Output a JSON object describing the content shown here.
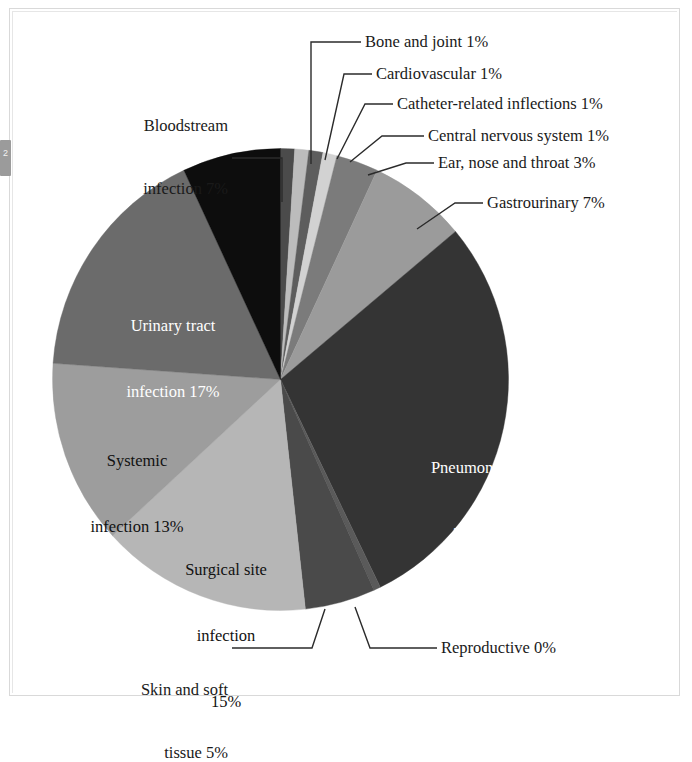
{
  "figure": {
    "type": "pie-chart-figure",
    "edge_tab_glyph": "2"
  },
  "chart_data": {
    "type": "pie",
    "title": "",
    "subtitle": "",
    "xlabel": "",
    "ylabel": "",
    "legend_position": "none",
    "units": "percent",
    "start_angle_deg": 0,
    "direction": "clockwise",
    "categories": [
      "Bone and joint",
      "Cardiovascular",
      "Catheter-related inflections",
      "Central nervous system",
      "Ear, nose and throat",
      "Gastrourinary",
      "Pneumonia",
      "Reproductive",
      "Skin and soft tissue",
      "Surgical site infection",
      "Systemic infection",
      "Urinary tract infection",
      "Bloodstream infection"
    ],
    "values": [
      1,
      1,
      1,
      1,
      3,
      7,
      29,
      0.5,
      5,
      15,
      13,
      17,
      7
    ],
    "value_labels": [
      "1%",
      "1%",
      "1%",
      "1%",
      "3%",
      "7%",
      "29%",
      "0%",
      "5%",
      "15%",
      "13%",
      "17%",
      "7%"
    ],
    "colors": [
      "#4b4b4b",
      "#bcbcbc",
      "#5d5d5d",
      "#d2d2d2",
      "#7b7b7b",
      "#9b9b9b",
      "#343434",
      "#5a5a5a",
      "#4a4a4a",
      "#b6b6b6",
      "#9d9d9d",
      "#6b6b6b",
      "#0d0d0d"
    ]
  },
  "callouts": [
    {
      "id": "bone-and-joint",
      "text": "Bone and joint 1%"
    },
    {
      "id": "cardiovascular",
      "text": "Cardiovascular 1%"
    },
    {
      "id": "catheter-related",
      "text": "Catheter-related inflections 1%"
    },
    {
      "id": "central-nervous-system",
      "text": "Central nervous system 1%"
    },
    {
      "id": "ear-nose-throat",
      "text": "Ear, nose and throat 3%"
    },
    {
      "id": "gastrourinary",
      "text": "Gastrourinary 7%"
    },
    {
      "id": "reproductive",
      "text": "Reproductive 0%"
    }
  ],
  "labels": {
    "bloodstream_line1": "Bloodstream",
    "bloodstream_line2": "infection 7%",
    "urinary_line1": "Urinary tract",
    "urinary_line2": "infection 17%",
    "systemic_line1": "Systemic",
    "systemic_line2": "infection 13%",
    "surgical_line1": "Surgical site",
    "surgical_line2": "infection",
    "surgical_line3": "15%",
    "pneumonia_line1": "Pneumonia",
    "pneumonia_line2": "29%",
    "skin_line1": "Skin and soft",
    "skin_line2": "tissue 5%"
  }
}
